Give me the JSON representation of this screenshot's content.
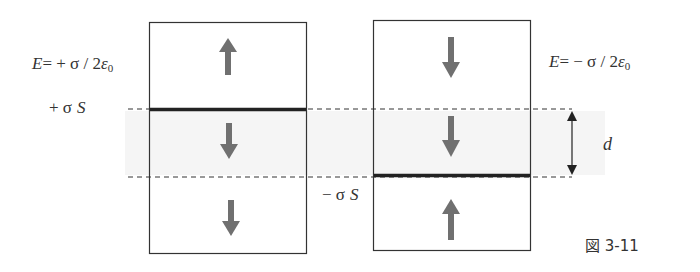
{
  "figure": {
    "caption": "図 3-11",
    "left_label_field": {
      "E": "E",
      "eq": "= + σ / 2",
      "eps": "ε",
      "sub": "0"
    },
    "left_label_charge": {
      "sign": "+ σ",
      "S": "S"
    },
    "right_label_field": {
      "E": "E",
      "eq": "=  − σ / 2",
      "eps": "ε",
      "sub": "0"
    },
    "right_label_charge": {
      "sign": "− σ",
      "S": "S"
    },
    "separation_label": "d",
    "colors": {
      "box_border": "#333333",
      "plate": "#222222",
      "arrow": "#707070",
      "dashed": "#333333",
      "band": "#f4f4f4"
    },
    "left_box": {
      "arrows": [
        {
          "region": "above-plate",
          "direction": "up"
        },
        {
          "region": "between",
          "direction": "down"
        },
        {
          "region": "below",
          "direction": "down"
        }
      ]
    },
    "right_box": {
      "arrows": [
        {
          "region": "above",
          "direction": "down"
        },
        {
          "region": "between",
          "direction": "down"
        },
        {
          "region": "below-plate",
          "direction": "up"
        }
      ]
    }
  }
}
